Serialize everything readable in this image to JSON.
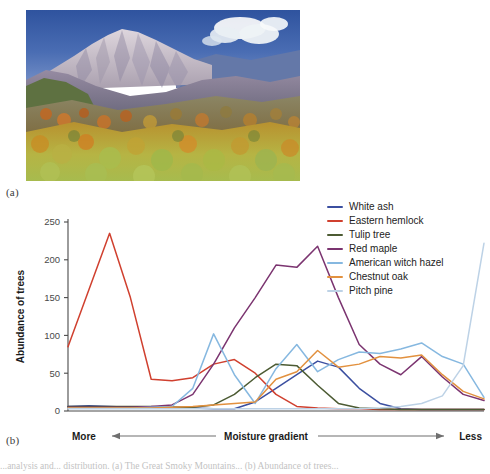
{
  "figure": {
    "panel_a_label": "(a)",
    "panel_b_label": "(b)",
    "caption": "...analysis and... distribution. (a) The Great Smoky Mountains... (b) Abundance of trees..."
  },
  "photo": {
    "alt_name": "autumn-mountain-photograph",
    "sky_color": "#3f63ab",
    "snow_color": "#cfc6cd",
    "ridge_color": "#8d8296",
    "cloud_color": "#f2f4f6",
    "foliage_green": "#9fb84a",
    "foliage_orange": "#d8862c",
    "foliage_yellow": "#d9b43b",
    "foliage_dark": "#6e7a3a"
  },
  "chart_data": {
    "type": "line",
    "title": "",
    "xlabel": "Moisture gradient",
    "ylabel": "Abundance of trees",
    "ylim": [
      0,
      250
    ],
    "yticks": [
      0,
      50,
      100,
      150,
      200,
      250
    ],
    "ytick_labels": [
      "0",
      "50",
      "100",
      "150",
      "200",
      "250"
    ],
    "xlim": [
      0,
      20
    ],
    "grid": false,
    "legend_position": "top-right",
    "x_axis_left_label": "More",
    "x_axis_right_label": "Less",
    "x": [
      0,
      1,
      2,
      3,
      4,
      5,
      6,
      7,
      8,
      9,
      10,
      11,
      12,
      13,
      14,
      15,
      16,
      17,
      18,
      19,
      20
    ],
    "series": [
      {
        "name": "White ash",
        "color": "#3b4fa0",
        "values": [
          6,
          7,
          6,
          5,
          5,
          5,
          4,
          3,
          3,
          12,
          30,
          48,
          66,
          58,
          30,
          10,
          3,
          2,
          2,
          2,
          2
        ]
      },
      {
        "name": "Eastern hemlock",
        "color": "#d0402f",
        "values": [
          85,
          160,
          235,
          150,
          42,
          40,
          44,
          62,
          68,
          50,
          22,
          6,
          4,
          3,
          3,
          2,
          2,
          2,
          2,
          2,
          2
        ]
      },
      {
        "name": "Tulip tree",
        "color": "#4c5b33",
        "values": [
          6,
          6,
          6,
          6,
          6,
          5,
          5,
          8,
          22,
          44,
          62,
          60,
          34,
          10,
          4,
          3,
          2,
          2,
          2,
          2,
          2
        ]
      },
      {
        "name": "Red maple",
        "color": "#7b3470",
        "values": [
          5,
          5,
          5,
          5,
          6,
          8,
          22,
          62,
          110,
          150,
          193,
          190,
          218,
          150,
          88,
          62,
          48,
          72,
          45,
          22,
          14
        ]
      },
      {
        "name": "American witch hazel",
        "color": "#86b8e0",
        "values": [
          4,
          4,
          4,
          4,
          5,
          6,
          30,
          102,
          48,
          10,
          56,
          88,
          52,
          68,
          78,
          76,
          82,
          90,
          72,
          62,
          18
        ]
      },
      {
        "name": "Chestnut oak",
        "color": "#e2913f",
        "values": [
          4,
          4,
          4,
          4,
          4,
          5,
          6,
          8,
          10,
          12,
          42,
          52,
          80,
          58,
          62,
          72,
          70,
          74,
          48,
          26,
          16
        ]
      },
      {
        "name": "Pitch pine",
        "color": "#bdd2e6",
        "values": [
          3,
          3,
          3,
          3,
          3,
          3,
          3,
          3,
          3,
          3,
          3,
          3,
          3,
          3,
          3,
          4,
          6,
          10,
          20,
          60,
          222
        ]
      }
    ]
  }
}
